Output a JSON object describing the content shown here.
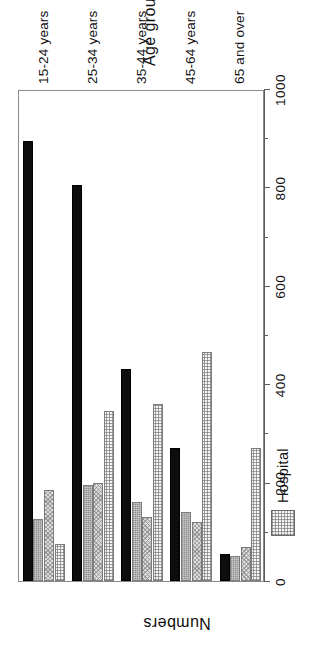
{
  "chart_data": {
    "type": "bar",
    "title": "",
    "xlabel": "Age group",
    "ylabel": "Numbers",
    "ylim": [
      0,
      1000
    ],
    "ytick_labels": [
      "0",
      "200",
      "400",
      "600",
      "800",
      "1000"
    ],
    "ytick_values": [
      0,
      200,
      400,
      600,
      800,
      1000
    ],
    "minor_tick_step": 100,
    "grid": false,
    "orientation": "rotated-90-ccw",
    "legend_position": "top-left-outside",
    "categories": [
      "15-24 years",
      "25-34 years",
      "35-44 years",
      "45-64 years",
      "65 and over"
    ],
    "series": [
      {
        "name": "Family home'",
        "key": "family",
        "color": "#0d0d0d",
        "values": [
          895,
          805,
          430,
          270,
          55
        ]
      },
      {
        "name": "LA",
        "key": "la",
        "color": "#8e8e8e",
        "values": [
          125,
          195,
          160,
          140,
          50
        ]
      },
      {
        "name": "PV",
        "key": "pv",
        "color": "#dcdcdc",
        "values": [
          185,
          200,
          130,
          120,
          70
        ]
      },
      {
        "name": "Hospital",
        "key": "hospital",
        "color": "#f4f4f4",
        "values": [
          75,
          345,
          360,
          465,
          270
        ]
      }
    ]
  },
  "legend": {
    "items": [
      {
        "label": "Family home'",
        "swatch": "family"
      },
      {
        "label": "LA",
        "swatch": "la"
      },
      {
        "label": "PV",
        "swatch": "pv"
      },
      {
        "label": "Hospital",
        "swatch": "hospital"
      }
    ]
  },
  "axes": {
    "value_axis_title": "Numbers",
    "category_axis_title": "Age group"
  }
}
